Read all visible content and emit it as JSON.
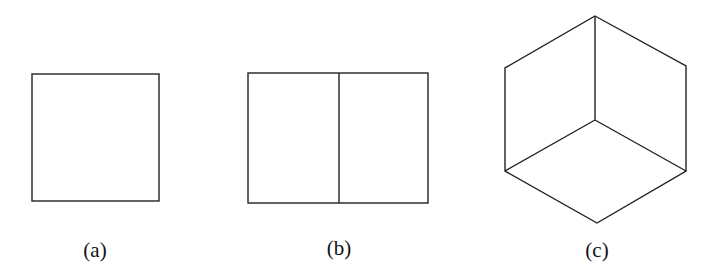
{
  "figures": [
    {
      "label": "(a)",
      "shape": "square"
    },
    {
      "label": "(b)",
      "shape": "rectangle split into two squares"
    },
    {
      "label": "(c)",
      "shape": "isometric cube outline (hexagon with three inner edges)"
    }
  ],
  "stroke_color": "#222222"
}
